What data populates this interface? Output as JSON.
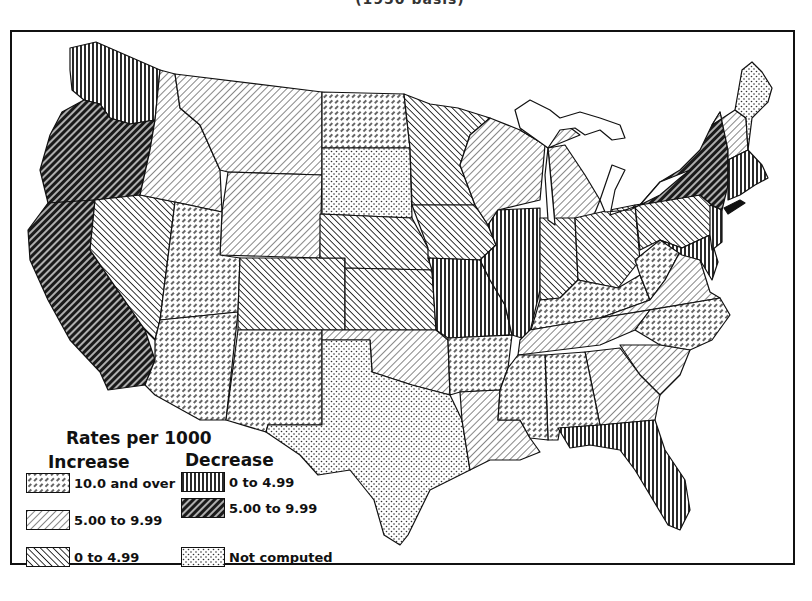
{
  "header": {
    "title_partial": "(1950 basis)"
  },
  "legend": {
    "title": "Rates per 1000",
    "increase_heading": "Increase",
    "decrease_heading": "Decrease",
    "items": [
      {
        "group": "Increase",
        "label": "10.0 and over",
        "pattern": "dashed-diagonal-light"
      },
      {
        "group": "Increase",
        "label": "5.00 to 9.99",
        "pattern": "forward-diagonal-light"
      },
      {
        "group": "Increase",
        "label": "0 to 4.99",
        "pattern": "back-diagonal-medium"
      },
      {
        "group": "Decrease",
        "label": "0 to 4.99",
        "pattern": "vertical-lines"
      },
      {
        "group": "Decrease",
        "label": "5.00 to 9.99",
        "pattern": "forward-diagonal-dark"
      },
      {
        "group": "Other",
        "label": "Not computed",
        "pattern": "dots"
      }
    ]
  },
  "map": {
    "region": "Continental United States",
    "states": [
      {
        "name": "Washington",
        "category": "Decrease 0 to 4.99"
      },
      {
        "name": "Oregon",
        "category": "Decrease 5.00 to 9.99"
      },
      {
        "name": "California",
        "category": "Decrease 5.00 to 9.99"
      },
      {
        "name": "Nevada",
        "category": "Increase 0 to 4.99"
      },
      {
        "name": "Idaho",
        "category": "Increase 5.00 to 9.99"
      },
      {
        "name": "Montana",
        "category": "Increase 5.00 to 9.99"
      },
      {
        "name": "Wyoming",
        "category": "Increase 5.00 to 9.99"
      },
      {
        "name": "Utah",
        "category": "Increase 10.0 and over"
      },
      {
        "name": "Arizona",
        "category": "Increase 10.0 and over"
      },
      {
        "name": "Colorado",
        "category": "Increase 0 to 4.99"
      },
      {
        "name": "New Mexico",
        "category": "Increase 10.0 and over"
      },
      {
        "name": "North Dakota",
        "category": "Increase 10.0 and over"
      },
      {
        "name": "South Dakota",
        "category": "Not computed"
      },
      {
        "name": "Nebraska",
        "category": "Increase 0 to 4.99"
      },
      {
        "name": "Kansas",
        "category": "Increase 0 to 4.99"
      },
      {
        "name": "Oklahoma",
        "category": "Increase 5.00 to 9.99"
      },
      {
        "name": "Texas",
        "category": "Not computed"
      },
      {
        "name": "Minnesota",
        "category": "Increase 0 to 4.99"
      },
      {
        "name": "Iowa",
        "category": "Increase 0 to 4.99"
      },
      {
        "name": "Missouri",
        "category": "Decrease 0 to 4.99"
      },
      {
        "name": "Arkansas",
        "category": "Increase 10.0 and over"
      },
      {
        "name": "Louisiana",
        "category": "Increase 5.00 to 9.99"
      },
      {
        "name": "Wisconsin",
        "category": "Increase 5.00 to 9.99"
      },
      {
        "name": "Illinois",
        "category": "Decrease 0 to 4.99"
      },
      {
        "name": "Michigan",
        "category": "Increase 5.00 to 9.99"
      },
      {
        "name": "Indiana",
        "category": "Increase 0 to 4.99"
      },
      {
        "name": "Ohio",
        "category": "Increase 0 to 4.99"
      },
      {
        "name": "Kentucky",
        "category": "Increase 10.0 and over"
      },
      {
        "name": "Tennessee",
        "category": "Increase 5.00 to 9.99"
      },
      {
        "name": "Mississippi",
        "category": "Increase 10.0 and over"
      },
      {
        "name": "Alabama",
        "category": "Increase 10.0 and over"
      },
      {
        "name": "Georgia",
        "category": "Increase 5.00 to 9.99"
      },
      {
        "name": "Florida",
        "category": "Decrease 0 to 4.99"
      },
      {
        "name": "South Carolina",
        "category": "Increase 5.00 to 9.99"
      },
      {
        "name": "North Carolina",
        "category": "Increase 10.0 and over"
      },
      {
        "name": "Virginia",
        "category": "Increase 5.00 to 9.99"
      },
      {
        "name": "West Virginia",
        "category": "Increase 10.0 and over"
      },
      {
        "name": "Pennsylvania",
        "category": "Increase 0 to 4.99"
      },
      {
        "name": "Maryland / Delaware",
        "category": "Decrease 0 to 4.99"
      },
      {
        "name": "New Jersey",
        "category": "Decrease 0 to 4.99"
      },
      {
        "name": "New York",
        "category": "Decrease 5.00 to 9.99"
      },
      {
        "name": "Vermont / New Hampshire",
        "category": "Increase 5.00 to 9.99"
      },
      {
        "name": "Massachusetts / Connecticut / Rhode Island",
        "category": "Decrease 0 to 4.99"
      },
      {
        "name": "Maine",
        "category": "Not computed"
      }
    ]
  }
}
